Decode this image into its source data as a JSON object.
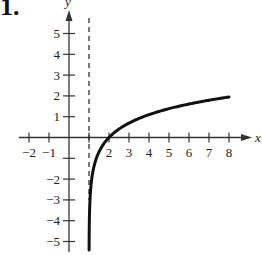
{
  "problem_label": "1.",
  "chart_data": {
    "type": "line",
    "title": "",
    "xlabel": "x",
    "ylabel": "y",
    "function": "y = ln(x - 1)",
    "xlim": [
      -2.5,
      9
    ],
    "ylim": [
      -5.5,
      6
    ],
    "x_ticks": [
      -2,
      -1,
      1,
      2,
      3,
      4,
      5,
      6,
      7,
      8
    ],
    "x_tick_labels": [
      "−2",
      "−1",
      "",
      "2",
      "3",
      "4",
      "5",
      "6",
      "7",
      "8"
    ],
    "y_ticks": [
      5,
      4,
      3,
      2,
      1,
      -1,
      -2,
      -3,
      -4,
      -5
    ],
    "y_tick_labels": [
      "5",
      "4",
      "3",
      "2",
      "1",
      "",
      "−2",
      "−3",
      "−4",
      "−5"
    ],
    "asymptote": {
      "type": "vertical",
      "x": 1,
      "style": "dashed"
    },
    "series": [
      {
        "name": "ln(x-1)",
        "x": [
          1.0045,
          1.01,
          1.05,
          1.1,
          1.2,
          1.5,
          2,
          3,
          4,
          5,
          6,
          7,
          8
        ],
        "y": [
          -5.4,
          -4.61,
          -3.0,
          -2.3,
          -1.61,
          -0.69,
          0,
          0.69,
          1.1,
          1.39,
          1.61,
          1.79,
          1.95
        ]
      }
    ],
    "grid": false,
    "legend": null
  }
}
